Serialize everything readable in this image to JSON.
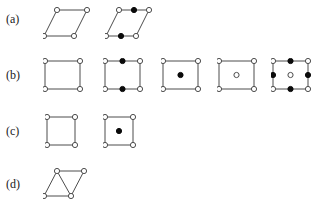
{
  "figure": {
    "type": "lattice-unit-cell-diagram",
    "background_color": "#ffffff",
    "line_color": "#4d4d4d",
    "open_node_fill": "#ffffff",
    "filled_node_fill": "#0a0a0a",
    "node_radius": 2.6,
    "rows": [
      {
        "label": "(a)",
        "label_name": "row-label-a",
        "cells": [
          {
            "name": "oblique-primitive-cell",
            "shape": "parallelogram",
            "outline": [
              [
                14,
                4
              ],
              [
                44,
                4
              ],
              [
                31,
                30
              ],
              [
                1,
                30
              ]
            ],
            "edges": [
              [
                0,
                1
              ],
              [
                1,
                2
              ],
              [
                2,
                3
              ],
              [
                3,
                0
              ]
            ],
            "nodes": [
              {
                "x": 14,
                "y": 4,
                "fill": "open"
              },
              {
                "x": 44,
                "y": 4,
                "fill": "open"
              },
              {
                "x": 31,
                "y": 30,
                "fill": "open"
              },
              {
                "x": 1,
                "y": 30,
                "fill": "open"
              }
            ]
          },
          {
            "name": "oblique-edge-centered-cell",
            "shape": "parallelogram",
            "outline": [
              [
                14,
                4
              ],
              [
                44,
                4
              ],
              [
                31,
                30
              ],
              [
                1,
                30
              ]
            ],
            "edges": [
              [
                0,
                1
              ],
              [
                1,
                2
              ],
              [
                2,
                3
              ],
              [
                3,
                0
              ]
            ],
            "nodes": [
              {
                "x": 14,
                "y": 4,
                "fill": "open"
              },
              {
                "x": 44,
                "y": 4,
                "fill": "open"
              },
              {
                "x": 31,
                "y": 30,
                "fill": "open"
              },
              {
                "x": 1,
                "y": 30,
                "fill": "open"
              },
              {
                "x": 29,
                "y": 4,
                "fill": "filled"
              },
              {
                "x": 16,
                "y": 30,
                "fill": "filled"
              }
            ]
          }
        ]
      },
      {
        "label": "(b)",
        "label_name": "row-label-b",
        "cells": [
          {
            "name": "rectangular-primitive-cell",
            "shape": "rectangle",
            "outline": [
              [
                2,
                3
              ],
              [
                37,
                3
              ],
              [
                37,
                31
              ],
              [
                2,
                31
              ]
            ],
            "edges": [
              [
                0,
                1
              ],
              [
                1,
                2
              ],
              [
                2,
                3
              ],
              [
                3,
                0
              ]
            ],
            "nodes": [
              {
                "x": 2,
                "y": 3,
                "fill": "open"
              },
              {
                "x": 37,
                "y": 3,
                "fill": "open"
              },
              {
                "x": 37,
                "y": 31,
                "fill": "open"
              },
              {
                "x": 2,
                "y": 31,
                "fill": "open"
              }
            ]
          },
          {
            "name": "rectangular-top-bottom-edge-centered-cell",
            "shape": "rectangle",
            "outline": [
              [
                2,
                3
              ],
              [
                37,
                3
              ],
              [
                37,
                31
              ],
              [
                2,
                31
              ]
            ],
            "edges": [
              [
                0,
                1
              ],
              [
                1,
                2
              ],
              [
                2,
                3
              ],
              [
                3,
                0
              ]
            ],
            "nodes": [
              {
                "x": 2,
                "y": 3,
                "fill": "open"
              },
              {
                "x": 37,
                "y": 3,
                "fill": "open"
              },
              {
                "x": 37,
                "y": 31,
                "fill": "open"
              },
              {
                "x": 2,
                "y": 31,
                "fill": "open"
              },
              {
                "x": 19.5,
                "y": 3,
                "fill": "filled"
              },
              {
                "x": 19.5,
                "y": 31,
                "fill": "filled"
              }
            ]
          },
          {
            "name": "rectangular-body-centered-filled-cell",
            "shape": "rectangle",
            "outline": [
              [
                2,
                3
              ],
              [
                37,
                3
              ],
              [
                37,
                31
              ],
              [
                2,
                31
              ]
            ],
            "edges": [
              [
                0,
                1
              ],
              [
                1,
                2
              ],
              [
                2,
                3
              ],
              [
                3,
                0
              ]
            ],
            "nodes": [
              {
                "x": 2,
                "y": 3,
                "fill": "open"
              },
              {
                "x": 37,
                "y": 3,
                "fill": "open"
              },
              {
                "x": 37,
                "y": 31,
                "fill": "open"
              },
              {
                "x": 2,
                "y": 31,
                "fill": "open"
              },
              {
                "x": 19.5,
                "y": 17,
                "fill": "filled"
              }
            ]
          },
          {
            "name": "rectangular-body-centered-open-cell",
            "shape": "rectangle",
            "outline": [
              [
                2,
                3
              ],
              [
                37,
                3
              ],
              [
                37,
                31
              ],
              [
                2,
                31
              ]
            ],
            "edges": [
              [
                0,
                1
              ],
              [
                1,
                2
              ],
              [
                2,
                3
              ],
              [
                3,
                0
              ]
            ],
            "nodes": [
              {
                "x": 2,
                "y": 3,
                "fill": "open"
              },
              {
                "x": 37,
                "y": 3,
                "fill": "open"
              },
              {
                "x": 37,
                "y": 31,
                "fill": "open"
              },
              {
                "x": 2,
                "y": 31,
                "fill": "open"
              },
              {
                "x": 19.5,
                "y": 17,
                "fill": "open"
              }
            ]
          },
          {
            "name": "rectangular-all-edge-centered-cell",
            "shape": "rectangle",
            "outline": [
              [
                2,
                3
              ],
              [
                37,
                3
              ],
              [
                37,
                31
              ],
              [
                2,
                31
              ]
            ],
            "edges": [
              [
                0,
                1
              ],
              [
                1,
                2
              ],
              [
                2,
                3
              ],
              [
                3,
                0
              ]
            ],
            "nodes": [
              {
                "x": 2,
                "y": 3,
                "fill": "open"
              },
              {
                "x": 37,
                "y": 3,
                "fill": "open"
              },
              {
                "x": 37,
                "y": 31,
                "fill": "open"
              },
              {
                "x": 2,
                "y": 31,
                "fill": "open"
              },
              {
                "x": 19.5,
                "y": 3,
                "fill": "filled"
              },
              {
                "x": 19.5,
                "y": 31,
                "fill": "filled"
              },
              {
                "x": 2,
                "y": 17,
                "fill": "filled"
              },
              {
                "x": 37,
                "y": 17,
                "fill": "filled"
              },
              {
                "x": 19.5,
                "y": 17,
                "fill": "open"
              }
            ]
          }
        ]
      },
      {
        "label": "(c)",
        "label_name": "row-label-c",
        "cells": [
          {
            "name": "square-primitive-cell",
            "shape": "square",
            "outline": [
              [
                2,
                3
              ],
              [
                30,
                3
              ],
              [
                30,
                31
              ],
              [
                2,
                31
              ]
            ],
            "edges": [
              [
                0,
                1
              ],
              [
                1,
                2
              ],
              [
                2,
                3
              ],
              [
                3,
                0
              ]
            ],
            "nodes": [
              {
                "x": 2,
                "y": 3,
                "fill": "open"
              },
              {
                "x": 30,
                "y": 3,
                "fill": "open"
              },
              {
                "x": 30,
                "y": 31,
                "fill": "open"
              },
              {
                "x": 2,
                "y": 31,
                "fill": "open"
              }
            ]
          },
          {
            "name": "square-body-centered-cell",
            "shape": "square",
            "outline": [
              [
                2,
                3
              ],
              [
                30,
                3
              ],
              [
                30,
                31
              ],
              [
                2,
                31
              ]
            ],
            "edges": [
              [
                0,
                1
              ],
              [
                1,
                2
              ],
              [
                2,
                3
              ],
              [
                3,
                0
              ]
            ],
            "nodes": [
              {
                "x": 2,
                "y": 3,
                "fill": "open"
              },
              {
                "x": 30,
                "y": 3,
                "fill": "open"
              },
              {
                "x": 30,
                "y": 31,
                "fill": "open"
              },
              {
                "x": 2,
                "y": 31,
                "fill": "open"
              },
              {
                "x": 16,
                "y": 17,
                "fill": "filled"
              }
            ]
          }
        ]
      },
      {
        "label": "(d)",
        "label_name": "row-label-d",
        "cells": [
          {
            "name": "hexagonal-rhombus-cell-with-diagonal",
            "shape": "parallelogram-with-diagonal",
            "outline": [
              [
                14,
                3
              ],
              [
                41,
                3
              ],
              [
                28,
                28
              ],
              [
                1,
                28
              ]
            ],
            "edges": [
              [
                0,
                1
              ],
              [
                1,
                2
              ],
              [
                2,
                3
              ],
              [
                3,
                0
              ],
              [
                0,
                2
              ]
            ],
            "nodes": [
              {
                "x": 14,
                "y": 3,
                "fill": "open"
              },
              {
                "x": 41,
                "y": 3,
                "fill": "open"
              },
              {
                "x": 28,
                "y": 28,
                "fill": "open"
              },
              {
                "x": 1,
                "y": 28,
                "fill": "open"
              }
            ]
          }
        ]
      }
    ],
    "cell_positions": {
      "a": [
        {
          "left": 43,
          "top": 6,
          "w": 48,
          "h": 36
        },
        {
          "left": 105,
          "top": 6,
          "w": 48,
          "h": 36
        }
      ],
      "b": [
        {
          "left": 43,
          "top": 58,
          "w": 42,
          "h": 36
        },
        {
          "left": 103,
          "top": 58,
          "w": 42,
          "h": 36
        },
        {
          "left": 161,
          "top": 58,
          "w": 42,
          "h": 36
        },
        {
          "left": 217,
          "top": 58,
          "w": 42,
          "h": 36
        },
        {
          "left": 271,
          "top": 58,
          "w": 42,
          "h": 36
        }
      ],
      "c": [
        {
          "left": 45,
          "top": 114,
          "w": 36,
          "h": 36
        },
        {
          "left": 103,
          "top": 114,
          "w": 36,
          "h": 36
        }
      ],
      "d": [
        {
          "left": 43,
          "top": 168,
          "w": 46,
          "h": 34
        }
      ]
    }
  }
}
